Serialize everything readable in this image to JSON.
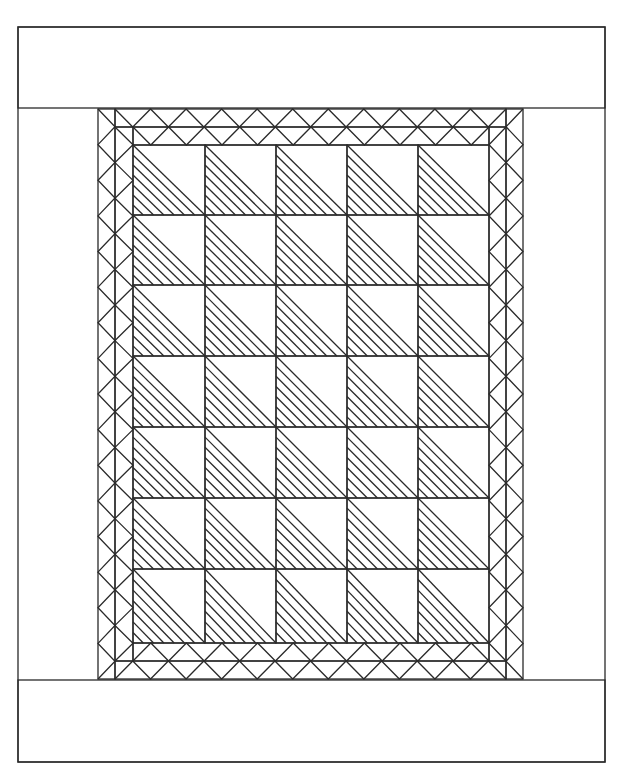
{
  "diagram": {
    "kind": "quilt-layout",
    "colors": {
      "line": "#2a2a2a",
      "background": "#ffffff"
    },
    "frame": {
      "x": 18,
      "y": 27,
      "w": 587,
      "h": 735
    },
    "top_border": {
      "x": 18,
      "y": 27,
      "w": 587,
      "h": 81
    },
    "bottom_border": {
      "x": 18,
      "y": 680,
      "w": 587,
      "h": 82
    },
    "outer_zigzag_band": {
      "left": {
        "x": 98,
        "y": 109,
        "w": 17,
        "h": 570,
        "teeth": 16
      },
      "right": {
        "x": 506,
        "y": 109,
        "w": 17,
        "h": 570,
        "teeth": 16
      },
      "top": {
        "x": 115,
        "y": 109,
        "w": 391,
        "h": 18,
        "teeth": 11
      },
      "bottom": {
        "x": 115,
        "y": 661,
        "w": 391,
        "h": 18,
        "teeth": 11
      }
    },
    "inner_zigzag_band": {
      "left": {
        "x": 115,
        "y": 127,
        "w": 18,
        "h": 534,
        "teeth": 15
      },
      "right": {
        "x": 489,
        "y": 127,
        "w": 17,
        "h": 534,
        "teeth": 15
      },
      "top": {
        "x": 133,
        "y": 127,
        "w": 356,
        "h": 18,
        "teeth": 10
      },
      "bottom": {
        "x": 133,
        "y": 643,
        "w": 356,
        "h": 18,
        "teeth": 10
      }
    },
    "block_grid": {
      "x": 133,
      "y": 145,
      "cols": 5,
      "rows": 7,
      "col_edges": [
        133,
        205,
        276,
        347,
        418,
        489
      ],
      "row_edges": [
        145,
        215,
        285,
        356,
        427,
        498,
        569,
        643
      ],
      "block_type": "half-square triangle, lower-left half hatched",
      "hatch_lines_per_block": 6
    }
  }
}
